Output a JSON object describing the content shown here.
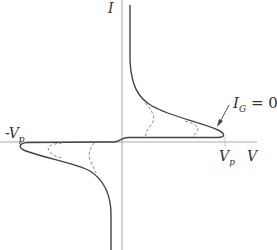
{
  "diagram": {
    "title": "",
    "axes": {
      "y_label": "I",
      "x_label": "V"
    },
    "x_ticks": [
      {
        "label": "-V",
        "subscript": "p",
        "position": "left"
      },
      {
        "label": "V",
        "subscript": "p",
        "position": "right"
      }
    ],
    "annotation": {
      "text_main": "I",
      "text_sub": "G",
      "text_rest": " = 0",
      "arrow": "pointer-to-solid-curve"
    },
    "curves": [
      {
        "name": "I_G = 0",
        "style": "solid",
        "quadrant": "first and third"
      },
      {
        "name": "family curves",
        "style": "dashed",
        "count": 4
      }
    ],
    "colors": {
      "axis": "#999999",
      "curve": "#444444",
      "dashed": "#888888",
      "text": "#333333"
    }
  }
}
